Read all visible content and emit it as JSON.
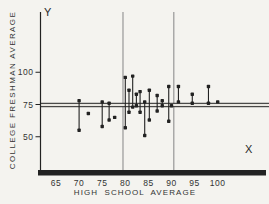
{
  "figure": {
    "y_axis_letter": "Y",
    "x_axis_letter": "X"
  },
  "colors": {
    "ink": "#222222",
    "text": "#333333",
    "reference_line": "#8f8f8f",
    "band_fill": "#e9e7e1",
    "background": "#f4f3ef"
  },
  "chart_data": {
    "type": "scatter",
    "title": "",
    "xlabel": "HIGH SCHOOL AVERAGE",
    "ylabel": "COLLEGE FRESHMAN AVERAGE",
    "x_ticks": [
      65,
      70,
      75,
      80,
      85,
      90,
      95,
      100
    ],
    "y_ticks": [
      100,
      75,
      50
    ],
    "xlim": [
      61,
      111
    ],
    "ylim": [
      47,
      115
    ],
    "grid": "off",
    "reference_lines": {
      "horizontal_double_line_y": 75,
      "vertical_lines_x": [
        79.5,
        90.5
      ]
    },
    "segments_note": "vertical segments with a dot at each end: x = high school average, hi/lo = college freshman averages",
    "segments": [
      {
        "x": 70,
        "hi": 78,
        "lo": 55
      },
      {
        "x": 75,
        "hi": 77,
        "lo": 58
      },
      {
        "x": 76.5,
        "hi": 76,
        "lo": 63
      },
      {
        "x": 80,
        "hi": 96,
        "lo": 57
      },
      {
        "x": 80.8,
        "hi": 86,
        "lo": 69
      },
      {
        "x": 81.6,
        "hi": 97,
        "lo": 73
      },
      {
        "x": 82.4,
        "hi": 83,
        "lo": 74
      },
      {
        "x": 83.2,
        "hi": 85,
        "lo": 69
      },
      {
        "x": 84.2,
        "hi": 77,
        "lo": 51
      },
      {
        "x": 85.2,
        "hi": 86,
        "lo": 63
      },
      {
        "x": 86.9,
        "hi": 82,
        "lo": 70
      },
      {
        "x": 88,
        "hi": 78,
        "lo": 74
      },
      {
        "x": 89.4,
        "hi": 89,
        "lo": 62
      },
      {
        "x": 91.5,
        "hi": 89,
        "lo": 77
      },
      {
        "x": 94.5,
        "hi": 83,
        "lo": 76
      },
      {
        "x": 98,
        "hi": 89,
        "lo": 76
      }
    ],
    "points": [
      {
        "x": 72,
        "y": 68
      },
      {
        "x": 77.7,
        "y": 65
      },
      {
        "x": 90,
        "y": 74
      },
      {
        "x": 100,
        "y": 77
      }
    ]
  }
}
